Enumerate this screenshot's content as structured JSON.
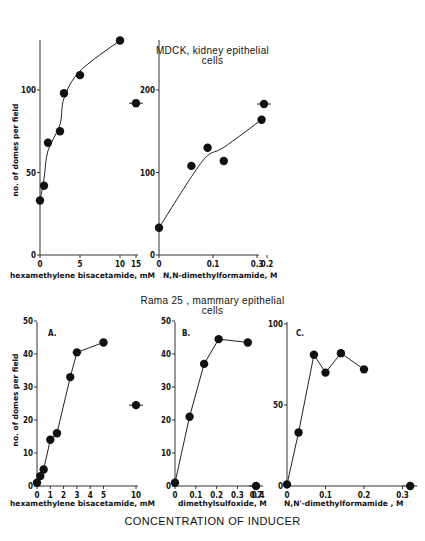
{
  "titles": {
    "top_line1": "MDCK, kidney epithelial",
    "top_line2": "cells",
    "bottom_line1": "Rama 25 , mammary  epithelial",
    "bottom_line2": "cells",
    "footer": "CONCENTRATION OF INDUCER"
  },
  "ylabel": "no. of domes per field",
  "chart_data": [
    {
      "id": "mdck-hmba",
      "type": "scatter",
      "title": "MDCK, kidney epithelial cells",
      "xlabel": "hexamethylene bisacetamide, mM",
      "ylabel": "no. of domes per field",
      "xticks": [
        "0",
        "5",
        "10",
        "15"
      ],
      "yticks": [
        "0",
        "50",
        "100"
      ],
      "ylim": [
        0,
        130
      ],
      "points": [
        [
          0,
          33
        ],
        [
          0.5,
          42
        ],
        [
          1,
          68
        ],
        [
          2.5,
          75
        ],
        [
          3,
          98
        ],
        [
          5,
          109
        ],
        [
          10,
          130
        ]
      ],
      "outliers": [
        [
          15,
          92
        ]
      ],
      "curve": true
    },
    {
      "id": "mdck-dmf",
      "type": "scatter",
      "title": "MDCK, kidney epithelial cells",
      "xlabel": "N,N-dimethylformamide, M",
      "ylabel": "",
      "xticks": [
        "0",
        "0.1",
        "0.2",
        "0.3"
      ],
      "yticks": [
        "0",
        "100",
        "200"
      ],
      "ylim": [
        0,
        260
      ],
      "points": [
        [
          0,
          33
        ],
        [
          0.06,
          108
        ],
        [
          0.09,
          130
        ],
        [
          0.12,
          114
        ],
        [
          0.19,
          164
        ]
      ],
      "outliers": [
        [
          0.34,
          183
        ]
      ],
      "curve": true
    },
    {
      "id": "rama-hmba",
      "panel": "A.",
      "type": "line",
      "title": "Rama 25, mammary epithelial cells",
      "xlabel": "hexamethylene bisacetamide, mM",
      "ylabel": "no. of domes per field",
      "xticks": [
        "0",
        "1",
        "2",
        "3",
        "4",
        "5",
        "10"
      ],
      "yticks": [
        "0",
        "10",
        "20",
        "30",
        "40",
        "50"
      ],
      "ylim": [
        0,
        50
      ],
      "points": [
        [
          0,
          1
        ],
        [
          0.25,
          3
        ],
        [
          0.5,
          5
        ],
        [
          1,
          14
        ],
        [
          1.5,
          16
        ],
        [
          2.5,
          33
        ],
        [
          3,
          40.5
        ],
        [
          5,
          43.5
        ]
      ],
      "outliers": [
        [
          10,
          24.5
        ]
      ]
    },
    {
      "id": "rama-dmso",
      "panel": "B.",
      "type": "line",
      "title": "Rama 25, mammary epithelial cells",
      "xlabel": "dimethylsulfoxide, M",
      "ylabel": "",
      "xticks": [
        "0",
        "0.1",
        "0.2",
        "0.3",
        "0.4",
        "0.7"
      ],
      "yticks": [
        "0",
        "10",
        "20",
        "30",
        "40",
        "50"
      ],
      "ylim": [
        0,
        50
      ],
      "points": [
        [
          0,
          1
        ],
        [
          0.07,
          21
        ],
        [
          0.14,
          37
        ],
        [
          0.21,
          44.5
        ],
        [
          0.35,
          43.5
        ]
      ],
      "outliers": [
        [
          0.7,
          0
        ]
      ]
    },
    {
      "id": "rama-dmf",
      "panel": "C.",
      "type": "line",
      "title": "Rama 25, mammary epithelial cells",
      "xlabel": "N,N'-dimethylformamide , M",
      "ylabel": "",
      "xticks": [
        "0",
        "0.1",
        "0.2",
        "0.3"
      ],
      "yticks": [
        "0",
        "50",
        "100"
      ],
      "ylim": [
        0,
        100
      ],
      "points": [
        [
          0,
          1
        ],
        [
          0.03,
          33
        ],
        [
          0.07,
          81
        ],
        [
          0.1,
          70
        ],
        [
          0.14,
          82
        ],
        [
          0.2,
          72
        ]
      ],
      "outliers": [
        [
          0.32,
          0
        ]
      ]
    }
  ]
}
